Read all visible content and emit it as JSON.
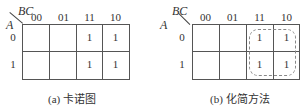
{
  "maps": [
    {
      "id": "a",
      "col_var": "BC",
      "row_var": "A",
      "col_headers": [
        "00",
        "01",
        "11",
        "10"
      ],
      "row_headers": [
        "0",
        "1"
      ],
      "cells": [
        [
          "",
          "",
          "1",
          "1"
        ],
        [
          "",
          "",
          "1",
          "1"
        ]
      ],
      "caption": "(a) 卡诺图",
      "groups": []
    },
    {
      "id": "b",
      "col_var": "BC",
      "row_var": "A",
      "col_headers": [
        "00",
        "01",
        "11",
        "10"
      ],
      "row_headers": [
        "0",
        "1"
      ],
      "cells": [
        [
          "",
          "",
          "1",
          "1"
        ],
        [
          "",
          "",
          "1",
          "1"
        ]
      ],
      "caption": "(b) 化简方法",
      "groups": [
        {
          "columns": [
            "11",
            "10"
          ],
          "rows": [
            "0",
            "1"
          ],
          "style": "dashed"
        }
      ]
    }
  ]
}
